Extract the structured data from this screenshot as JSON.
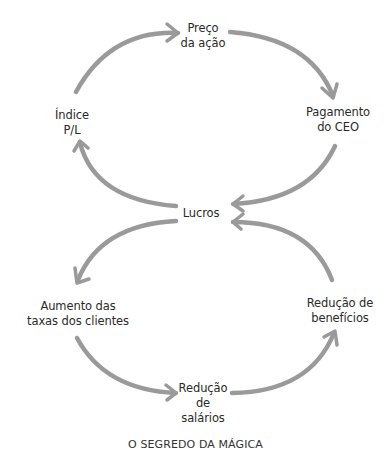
{
  "diagram": {
    "type": "causal-loop",
    "arrow_color": "#9a9a9a",
    "text_color": "#2a2a2a",
    "nodes": {
      "stock_price": {
        "line1": "Preço",
        "line2": "da ação"
      },
      "ceo_pay": {
        "line1": "Pagamento",
        "line2": "do CEO"
      },
      "pe_ratio": {
        "line1": "Índice",
        "line2": "P/L"
      },
      "profits": {
        "line1": "Lucros"
      },
      "customer_fees": {
        "line1": "Aumento das",
        "line2": "taxas dos clientes"
      },
      "benefit_cuts": {
        "line1": "Redução de",
        "line2": "benefícios"
      },
      "wage_cuts": {
        "line1": "Redução",
        "line2": "de",
        "line3": "salários"
      }
    },
    "edges": [
      {
        "from": "Índice P/L",
        "to": "Preço da ação"
      },
      {
        "from": "Preço da ação",
        "to": "Pagamento do CEO"
      },
      {
        "from": "Pagamento do CEO",
        "to": "Lucros"
      },
      {
        "from": "Lucros",
        "to": "Índice P/L"
      },
      {
        "from": "Lucros",
        "to": "Aumento das taxas dos clientes"
      },
      {
        "from": "Aumento das taxas dos clientes",
        "to": "Redução de salários"
      },
      {
        "from": "Redução de salários",
        "to": "Redução de benefícios"
      },
      {
        "from": "Redução de benefícios",
        "to": "Lucros"
      }
    ],
    "caption": "O SEGREDO DA MÁGICA"
  }
}
